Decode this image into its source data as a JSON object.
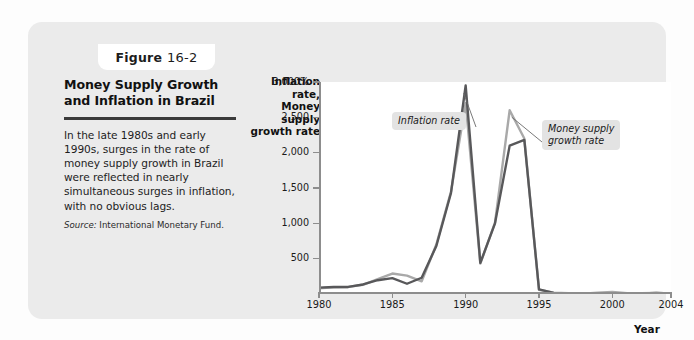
{
  "figure": {
    "badge_word": "Figure",
    "badge_number": "16-2",
    "title": "Money Supply Growth and Inflation in Brazil",
    "body": "In the late 1980s and early 1990s, surges in the rate of money supply growth in Brazil were reflected in nearly simultaneous surges in inflation, with no obvious lags.",
    "source_label": "Source:",
    "source_text": "International Monetary Fund."
  },
  "chart_data": {
    "type": "line",
    "title": "Money Supply Growth and Inflation in Brazil",
    "xlabel": "Year",
    "ylabel": "Inflation rate, Money supply growth rate",
    "ylabel_lines": [
      "Inflation rate,",
      "Money supply",
      "growth rate"
    ],
    "xlim": [
      1980,
      2004
    ],
    "ylim": [
      0,
      3000
    ],
    "grid": false,
    "legend_position": "annotations",
    "y_ticks": [
      500,
      1000,
      1500,
      2000,
      2500,
      3000
    ],
    "y_tick_labels": [
      "500",
      "1,000",
      "1,500",
      "2,000",
      "2,500",
      "3,000%"
    ],
    "x_ticks": [
      1980,
      1985,
      1990,
      1995,
      2000,
      2004
    ],
    "x_tick_labels": [
      "1980",
      "1985",
      "1990",
      "1995",
      "2000",
      "2004"
    ],
    "annotations": [
      {
        "name": "inflation-rate",
        "text": "Inflation rate"
      },
      {
        "name": "money-supply-growth-rate",
        "text": "Money supply\ngrowth rate",
        "line1": "Money supply",
        "line2": "growth rate"
      }
    ],
    "colors": {
      "inflation_line": "#58585a",
      "money_supply_line": "#a9a9a9",
      "axis": "#8d8d8d",
      "card_background": "#ebebeb",
      "plot_background": "#ffffff",
      "callout_background": "#e3e3e3"
    },
    "x": [
      1980,
      1981,
      1982,
      1983,
      1984,
      1985,
      1986,
      1987,
      1988,
      1989,
      1990,
      1991,
      1992,
      1993,
      1994,
      1995,
      1996,
      1997,
      1998,
      1999,
      2000,
      2001,
      2002,
      2003,
      2004
    ],
    "series": [
      {
        "name": "Inflation rate",
        "color": "#58585a",
        "values": [
          90,
          100,
          100,
          135,
          195,
          225,
          145,
          230,
          680,
          1430,
          2950,
          440,
          1000,
          2100,
          2180,
          65,
          16,
          7,
          3,
          5,
          7,
          7,
          9,
          15,
          7
        ]
      },
      {
        "name": "Money supply growth rate",
        "color": "#a9a9a9",
        "values": [
          80,
          95,
          100,
          130,
          210,
          290,
          260,
          180,
          700,
          1450,
          2700,
          430,
          1010,
          2600,
          2200,
          60,
          20,
          10,
          5,
          18,
          30,
          12,
          10,
          14,
          8
        ]
      }
    ]
  }
}
